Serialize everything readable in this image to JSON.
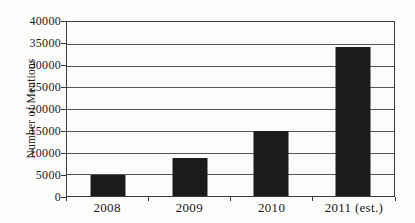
{
  "chart_data": {
    "type": "bar",
    "title": "",
    "xlabel": "",
    "ylabel": "Number of Mentions",
    "categories": [
      "2008",
      "2009",
      "2010",
      "2011 (est.)"
    ],
    "values": [
      4800,
      8700,
      15000,
      34200
    ],
    "ylim": [
      0,
      40000
    ],
    "ytick_step": 5000,
    "yticks": [
      0,
      5000,
      10000,
      15000,
      20000,
      25000,
      30000,
      35000,
      40000
    ],
    "ytick_labels": [
      "0",
      "5000",
      "10000",
      "15000",
      "20000",
      "25000",
      "30000",
      "35000",
      "40000"
    ],
    "grid": "horizontal",
    "legend": "none",
    "colors": {
      "bar": "#1b1b1b",
      "gridline": "#555555",
      "axis": "#3a3a3a",
      "text": "#1a1a1a",
      "background": "#fcfcfb"
    }
  }
}
